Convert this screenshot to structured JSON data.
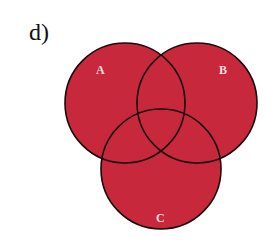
{
  "panel_label": "d)",
  "diagram": {
    "type": "venn-3",
    "fill_color": "#c8283c",
    "stroke_color": "#1a0a0c",
    "sets": [
      {
        "name": "A",
        "cx": 125,
        "cy": 103,
        "r": 60
      },
      {
        "name": "B",
        "cx": 197,
        "cy": 103,
        "r": 60
      },
      {
        "name": "C",
        "cx": 161,
        "cy": 169,
        "r": 60
      }
    ],
    "shaded": "A ∪ B ∪ C"
  }
}
